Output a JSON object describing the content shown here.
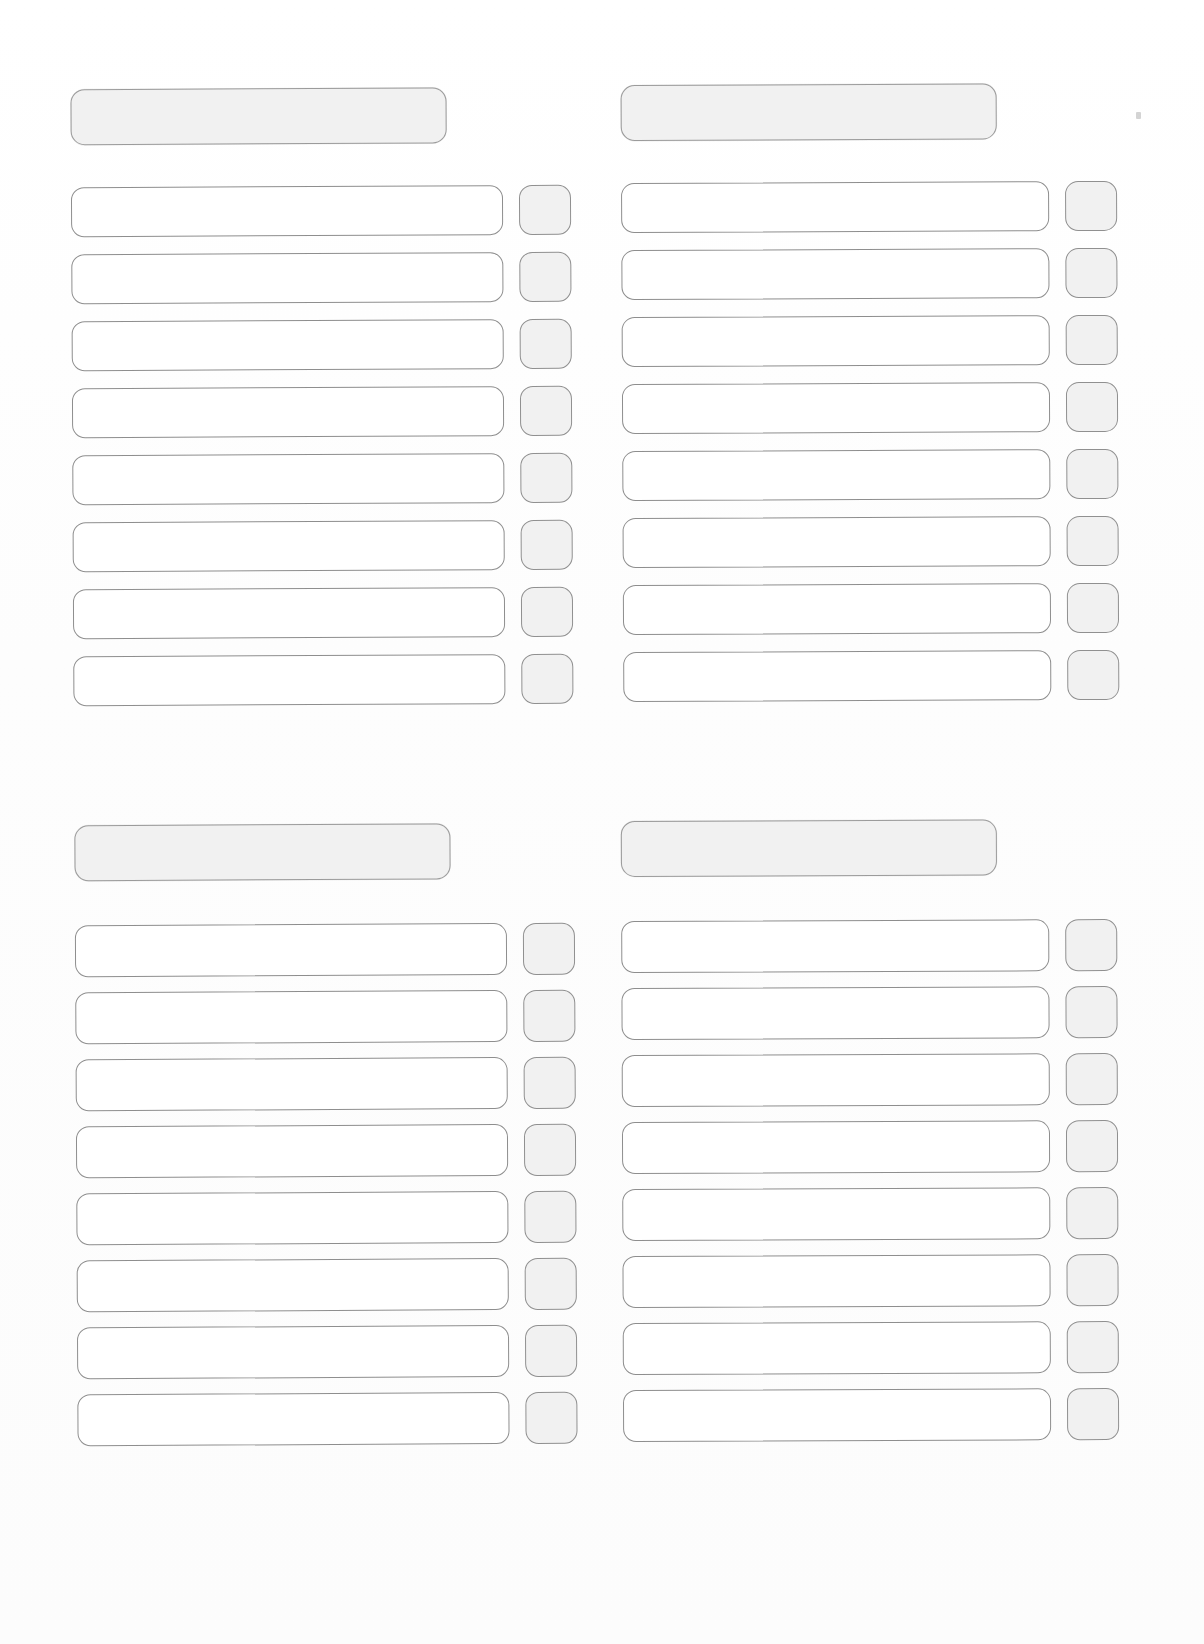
{
  "document": {
    "kind": "blank-scanned-form",
    "page_background": "#fefefe",
    "ink_color": "#8e8e8e",
    "shaded_fill": "#f1f1f1",
    "field_fill": "#ffffff"
  },
  "sections": [
    {
      "id": "top-left",
      "header": {
        "label": ""
      },
      "rows": [
        {
          "field": "",
          "check": ""
        },
        {
          "field": "",
          "check": ""
        },
        {
          "field": "",
          "check": ""
        },
        {
          "field": "",
          "check": ""
        },
        {
          "field": "",
          "check": ""
        },
        {
          "field": "",
          "check": ""
        },
        {
          "field": "",
          "check": ""
        },
        {
          "field": "",
          "check": ""
        }
      ]
    },
    {
      "id": "top-right",
      "header": {
        "label": ""
      },
      "rows": [
        {
          "field": "",
          "check": ""
        },
        {
          "field": "",
          "check": ""
        },
        {
          "field": "",
          "check": ""
        },
        {
          "field": "",
          "check": ""
        },
        {
          "field": "",
          "check": ""
        },
        {
          "field": "",
          "check": ""
        },
        {
          "field": "",
          "check": ""
        },
        {
          "field": "",
          "check": ""
        }
      ]
    },
    {
      "id": "bottom-left",
      "header": {
        "label": ""
      },
      "rows": [
        {
          "field": "",
          "check": ""
        },
        {
          "field": "",
          "check": ""
        },
        {
          "field": "",
          "check": ""
        },
        {
          "field": "",
          "check": ""
        },
        {
          "field": "",
          "check": ""
        },
        {
          "field": "",
          "check": ""
        },
        {
          "field": "",
          "check": ""
        },
        {
          "field": "",
          "check": ""
        }
      ]
    },
    {
      "id": "bottom-right",
      "header": {
        "label": ""
      },
      "rows": [
        {
          "field": "",
          "check": ""
        },
        {
          "field": "",
          "check": ""
        },
        {
          "field": "",
          "check": ""
        },
        {
          "field": "",
          "check": ""
        },
        {
          "field": "",
          "check": ""
        },
        {
          "field": "",
          "check": ""
        },
        {
          "field": "",
          "check": ""
        },
        {
          "field": "",
          "check": ""
        }
      ]
    }
  ],
  "layout": {
    "sections": {
      "top-left": {
        "x": 72,
        "y": 88,
        "header_w": 376,
        "header_h": 56,
        "rows_y": 186,
        "field_w": 432,
        "row_h": 50,
        "row_pitch": 67,
        "check_x": 448,
        "check_w": 52,
        "check_h": 50
      },
      "top-right": {
        "x": 622,
        "y": 84,
        "header_w": 376,
        "header_h": 56,
        "rows_y": 182,
        "field_w": 428,
        "row_h": 50,
        "row_pitch": 67,
        "check_x": 444,
        "check_w": 52,
        "check_h": 50
      },
      "bottom-left": {
        "x": 76,
        "y": 824,
        "header_w": 376,
        "header_h": 56,
        "rows_y": 924,
        "field_w": 432,
        "row_h": 52,
        "row_pitch": 67,
        "check_x": 448,
        "check_w": 52,
        "check_h": 52
      },
      "bottom-right": {
        "x": 622,
        "y": 820,
        "header_w": 376,
        "header_h": 56,
        "rows_y": 920,
        "field_w": 428,
        "row_h": 52,
        "row_pitch": 67,
        "check_x": 444,
        "check_w": 52,
        "check_h": 52
      }
    }
  }
}
